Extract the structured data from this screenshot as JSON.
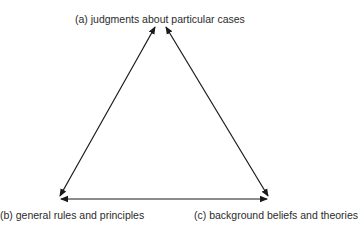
{
  "diagram": {
    "type": "triangle-reflective-equilibrium",
    "nodes": {
      "a": {
        "label": "(a) judgments about particular cases"
      },
      "b": {
        "label": "(b) general rules and principles"
      },
      "c": {
        "label": "(c) background beliefs and theories"
      }
    },
    "edges": [
      {
        "from": "a",
        "to": "b",
        "direction": "bidirectional"
      },
      {
        "from": "a",
        "to": "c",
        "direction": "bidirectional"
      },
      {
        "from": "b",
        "to": "c",
        "direction": "bidirectional"
      }
    ],
    "colors": {
      "text": "#2b2b2b",
      "arrow": "#1a1a1a",
      "background": "#ffffff"
    }
  }
}
